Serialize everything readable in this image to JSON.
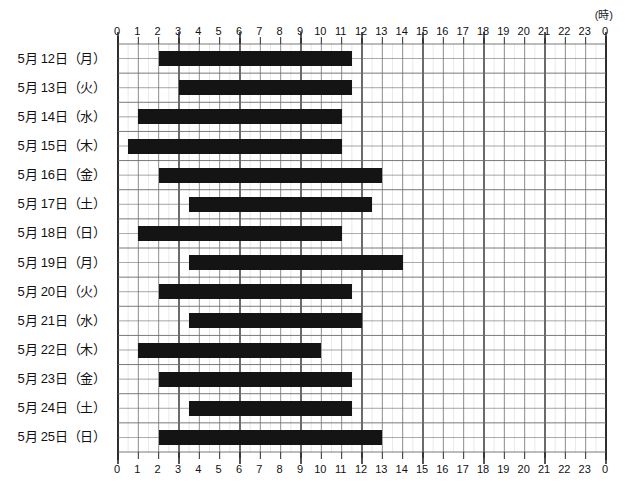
{
  "chart_data": {
    "type": "bar",
    "orientation": "horizontal",
    "title": "",
    "subtitle": "",
    "xlabel": "",
    "ylabel": "",
    "unit_label": "(時)",
    "xlim": [
      0,
      24
    ],
    "grid": true,
    "legend": null,
    "bar_color": "#141414",
    "axis_color": "#333333",
    "grid_color": "#6b6b6b",
    "minor_grid_color": "#c9c9c9",
    "x_tick_labels_top": [
      "0",
      "1",
      "2",
      "3",
      "4",
      "5",
      "6",
      "7",
      "8",
      "9",
      "10",
      "11",
      "12",
      "13",
      "14",
      "15",
      "16",
      "17",
      "18",
      "19",
      "20",
      "21",
      "22",
      "23",
      "0"
    ],
    "x_tick_labels_bottom": [
      "0",
      "1",
      "2",
      "3",
      "4",
      "5",
      "6",
      "7",
      "8",
      "9",
      "10",
      "11",
      "12",
      "13",
      "14",
      "15",
      "16",
      "17",
      "18",
      "19",
      "20",
      "21",
      "22",
      "23",
      "0"
    ],
    "categories": [
      "5月 12日（月）",
      "5月 13日（火）",
      "5月 14日（水）",
      "5月 15日（木）",
      "5月 16日（金）",
      "5月 17日（土）",
      "5月 18日（日）",
      "5月 19日（月）",
      "5月 20日（火）",
      "5月 21日（水）",
      "5月 22日（木）",
      "5月 23日（金）",
      "5月 24日（土）",
      "5月 25日（日）"
    ],
    "bars": [
      {
        "category": "5月 12日（月）",
        "start": 2.0,
        "end": 11.5,
        "duration": 9.5
      },
      {
        "category": "5月 13日（火）",
        "start": 3.0,
        "end": 11.5,
        "duration": 8.5
      },
      {
        "category": "5月 14日（水）",
        "start": 1.0,
        "end": 11.0,
        "duration": 10.0
      },
      {
        "category": "5月 15日（木）",
        "start": 0.5,
        "end": 11.0,
        "duration": 10.5
      },
      {
        "category": "5月 16日（金）",
        "start": 2.0,
        "end": 13.0,
        "duration": 11.0
      },
      {
        "category": "5月 17日（土）",
        "start": 3.5,
        "end": 12.5,
        "duration": 9.0
      },
      {
        "category": "5月 18日（日）",
        "start": 1.0,
        "end": 11.0,
        "duration": 10.0
      },
      {
        "category": "5月 19日（月）",
        "start": 3.5,
        "end": 14.0,
        "duration": 10.5
      },
      {
        "category": "5月 20日（火）",
        "start": 2.0,
        "end": 11.5,
        "duration": 9.5
      },
      {
        "category": "5月 21日（水）",
        "start": 3.5,
        "end": 12.0,
        "duration": 8.5
      },
      {
        "category": "5月 22日（木）",
        "start": 1.0,
        "end": 10.0,
        "duration": 9.0
      },
      {
        "category": "5月 23日（金）",
        "start": 2.0,
        "end": 11.5,
        "duration": 9.5
      },
      {
        "category": "5月 24日（土）",
        "start": 3.5,
        "end": 11.5,
        "duration": 8.0
      },
      {
        "category": "5月 25日（日）",
        "start": 2.0,
        "end": 13.0,
        "duration": 11.0
      }
    ]
  }
}
